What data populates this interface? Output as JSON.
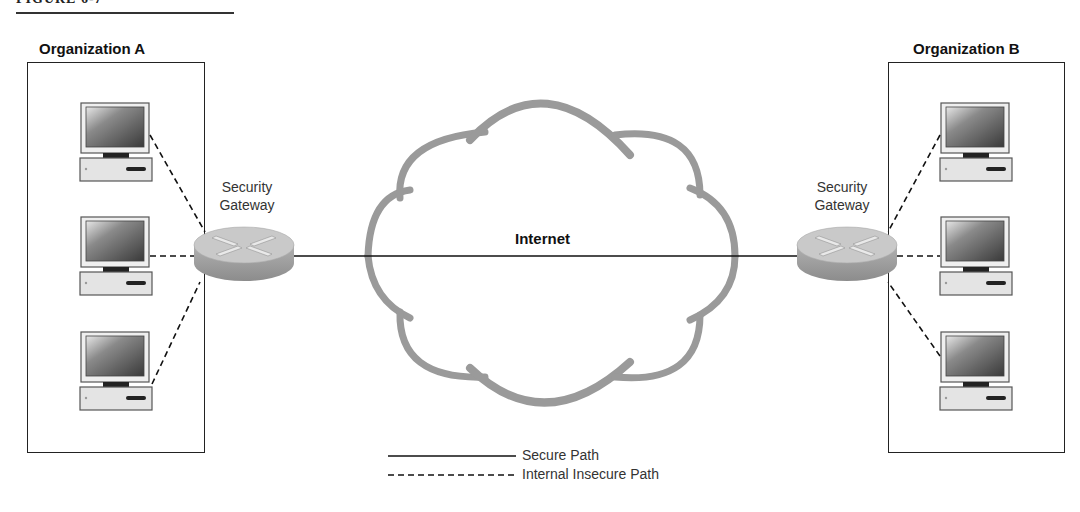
{
  "figure": {
    "label": "FIGURE 6-7"
  },
  "organizations": [
    {
      "name": "Organization A",
      "computers": 3
    },
    {
      "name": "Organization B",
      "computers": 3
    }
  ],
  "gateways": [
    {
      "label_line1": "Security",
      "label_line2": "Gateway"
    },
    {
      "label_line1": "Security",
      "label_line2": "Gateway"
    }
  ],
  "network": {
    "label": "Internet"
  },
  "legend": {
    "items": [
      {
        "style": "solid",
        "label": "Secure Path"
      },
      {
        "style": "dashed",
        "label": "Internal Insecure Path"
      }
    ]
  },
  "colors": {
    "line": "#111111",
    "cloud": "#9a9a9a",
    "router_top": "#c8c8c8",
    "router_side": "#9e9e9e",
    "monitor_screen": "#6a6a6a",
    "case": "#e6e6e6"
  }
}
